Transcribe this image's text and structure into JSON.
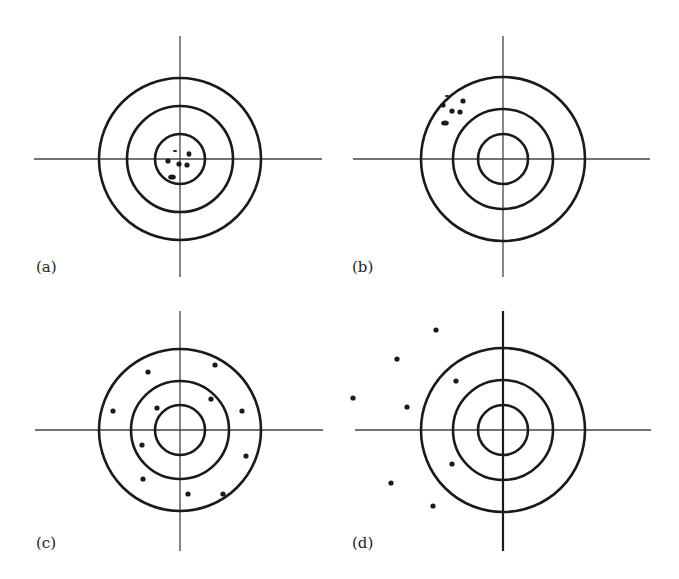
{
  "figure": {
    "colors": {
      "ink": "#1a1a1a",
      "background": "#ffffff"
    },
    "panels": [
      {
        "id": "a",
        "label": "(a)",
        "center": [
          180,
          159
        ],
        "rings": [
          81,
          53,
          25
        ],
        "hline": [
          34,
          322
        ],
        "vline": [
          36,
          277
        ],
        "vline_width": 1.3,
        "label_pos": [
          36,
          272
        ],
        "shots": [
          {
            "x": 168,
            "y": 161,
            "rx": 2.6,
            "ry": 2.6
          },
          {
            "x": 179,
            "y": 164,
            "rx": 2.6,
            "ry": 2.6
          },
          {
            "x": 187,
            "y": 165,
            "rx": 2.6,
            "ry": 2.6
          },
          {
            "x": 189,
            "y": 154,
            "rx": 2.4,
            "ry": 2.8
          },
          {
            "x": 175,
            "y": 151,
            "rx": 2.2,
            "ry": 1.0
          },
          {
            "x": 172,
            "y": 177,
            "rx": 3.8,
            "ry": 2.6
          }
        ]
      },
      {
        "id": "b",
        "label": "(b)",
        "center": [
          503,
          159
        ],
        "rings": [
          82,
          50,
          25
        ],
        "hline": [
          353,
          650
        ],
        "vline": [
          36,
          277
        ],
        "vline_width": 1.3,
        "label_pos": [
          352,
          272
        ],
        "shots": [
          {
            "x": 443,
            "y": 105,
            "rx": 2.6,
            "ry": 2.6
          },
          {
            "x": 463,
            "y": 101,
            "rx": 2.6,
            "ry": 2.6
          },
          {
            "x": 452,
            "y": 111,
            "rx": 2.6,
            "ry": 2.6
          },
          {
            "x": 460,
            "y": 112,
            "rx": 2.6,
            "ry": 2.6
          },
          {
            "x": 447,
            "y": 96,
            "rx": 2.2,
            "ry": 1.0
          },
          {
            "x": 445,
            "y": 123,
            "rx": 3.8,
            "ry": 2.6
          }
        ]
      },
      {
        "id": "c",
        "label": "(c)",
        "center": [
          180,
          430
        ],
        "rings": [
          81,
          49,
          25
        ],
        "hline": [
          35,
          323
        ],
        "vline": [
          311,
          551
        ],
        "vline_width": 1.3,
        "label_pos": [
          36,
          548
        ],
        "shots": [
          {
            "x": 148,
            "y": 372,
            "rx": 2.6,
            "ry": 2.6
          },
          {
            "x": 215,
            "y": 365,
            "rx": 2.6,
            "ry": 2.6
          },
          {
            "x": 211,
            "y": 399,
            "rx": 2.6,
            "ry": 2.6
          },
          {
            "x": 157,
            "y": 408,
            "rx": 2.6,
            "ry": 2.6
          },
          {
            "x": 113,
            "y": 411,
            "rx": 2.6,
            "ry": 2.6
          },
          {
            "x": 242,
            "y": 411,
            "rx": 2.6,
            "ry": 2.6
          },
          {
            "x": 142,
            "y": 445,
            "rx": 2.6,
            "ry": 2.6
          },
          {
            "x": 246,
            "y": 456,
            "rx": 2.6,
            "ry": 2.6
          },
          {
            "x": 143,
            "y": 479,
            "rx": 2.6,
            "ry": 2.6
          },
          {
            "x": 188,
            "y": 494,
            "rx": 2.6,
            "ry": 2.6
          },
          {
            "x": 223,
            "y": 494,
            "rx": 2.6,
            "ry": 2.6
          }
        ]
      },
      {
        "id": "d",
        "label": "(d)",
        "center": [
          503,
          430
        ],
        "rings": [
          82,
          50,
          25
        ],
        "hline": [
          355,
          651
        ],
        "vline": [
          311,
          551
        ],
        "vline_width": 2.2,
        "label_pos": [
          352,
          548
        ],
        "shots": [
          {
            "x": 436,
            "y": 330,
            "rx": 2.6,
            "ry": 2.6
          },
          {
            "x": 397,
            "y": 359,
            "rx": 2.6,
            "ry": 2.6
          },
          {
            "x": 456,
            "y": 381,
            "rx": 2.6,
            "ry": 2.6
          },
          {
            "x": 353,
            "y": 398,
            "rx": 2.6,
            "ry": 2.6
          },
          {
            "x": 407,
            "y": 407,
            "rx": 2.6,
            "ry": 2.6
          },
          {
            "x": 452,
            "y": 464,
            "rx": 2.6,
            "ry": 2.6
          },
          {
            "x": 391,
            "y": 483,
            "rx": 2.6,
            "ry": 2.6
          },
          {
            "x": 433,
            "y": 506,
            "rx": 2.6,
            "ry": 2.6
          }
        ]
      }
    ]
  }
}
